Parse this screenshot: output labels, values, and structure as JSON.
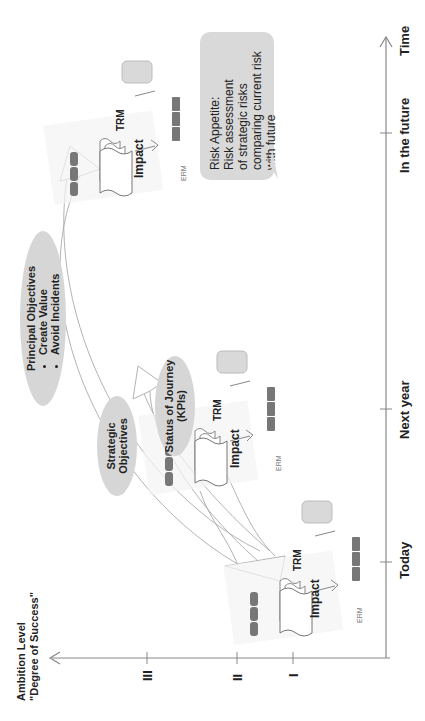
{
  "axes": {
    "y_label_line1": "Ambition Level",
    "y_label_line2": "\"Degree of Success\"",
    "y_ticks": [
      "III",
      "II",
      "I"
    ],
    "x_ticks": [
      "Today",
      "Next year",
      "In the future"
    ],
    "x_label": "Time"
  },
  "ellipses": {
    "principal": {
      "title": "Principal Objectives",
      "bullets": [
        "Create Value",
        "Avoid Incidents"
      ]
    },
    "strategic": {
      "title": "Strategic Objectives"
    },
    "status": {
      "line1": "Status of Journey",
      "line2": "(KPIs)"
    }
  },
  "clusters": [
    {
      "trm": "TRM",
      "impact": "Impact",
      "erm": "ERM"
    },
    {
      "trm": "TRM",
      "impact": "Impact",
      "erm": "ERM"
    },
    {
      "trm": "TRM",
      "impact": "Impact",
      "erm": "ERM"
    }
  ],
  "callout": {
    "lines": [
      "Risk Appetite:",
      "Risk assessment",
      "of strategic risks",
      "comparing current risk",
      "with future"
    ]
  },
  "colors": {
    "axis": "#888888",
    "ellipse_fill": "#d6d6d6",
    "callout_fill": "#d9d9d9",
    "text": "#222222"
  }
}
